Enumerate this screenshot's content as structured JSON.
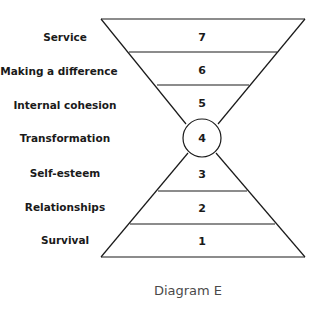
{
  "diagram": {
    "caption": "Diagram E",
    "center_level": {
      "label": "Transformation",
      "number": "4"
    },
    "levels": [
      {
        "label": "Service",
        "number": "7"
      },
      {
        "label": "Making a difference",
        "number": "6"
      },
      {
        "label": "Internal cohesion",
        "number": "5"
      },
      {
        "label": "Transformation",
        "number": "4"
      },
      {
        "label": "Self-esteem",
        "number": "3"
      },
      {
        "label": "Relationships",
        "number": "2"
      },
      {
        "label": "Survival",
        "number": "1"
      }
    ],
    "colors": {
      "stroke": "#1a1a1a",
      "text": "#1a1a1a",
      "caption": "#4a4a4a",
      "background": "#ffffff"
    }
  }
}
